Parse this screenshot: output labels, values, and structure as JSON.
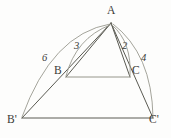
{
  "figure": {
    "type": "geometry-diagram",
    "background_color": "#fdfdfc",
    "stroke_color": "#5a5a52",
    "arc_color": "#9a9a90",
    "label_color": "#3a3a36",
    "width": 171,
    "height": 138
  },
  "vertices": {
    "A": {
      "label": "A",
      "x": 111,
      "y": 23,
      "label_x": 107,
      "label_y": 6
    },
    "B": {
      "label": "B",
      "x": 66,
      "y": 77,
      "label_x": 54,
      "label_y": 66
    },
    "C": {
      "label": "C",
      "x": 130,
      "y": 77,
      "label_x": 132,
      "label_y": 66
    },
    "Bp": {
      "label": "B'",
      "x": 22,
      "y": 118,
      "label_x": 8,
      "label_y": 115
    },
    "Cp": {
      "label": "C'",
      "x": 153,
      "y": 118,
      "label_x": 150,
      "label_y": 115
    }
  },
  "segments": [
    {
      "name": "A-Bp",
      "from": "A",
      "to": "Bp"
    },
    {
      "name": "A-B",
      "from": "A",
      "to": "B"
    },
    {
      "name": "A-C",
      "from": "A",
      "to": "C"
    },
    {
      "name": "A-Cp",
      "from": "A",
      "to": "Cp"
    },
    {
      "name": "B-C",
      "from": "B",
      "to": "C"
    },
    {
      "name": "Bp-Cp",
      "from": "Bp",
      "to": "Cp"
    }
  ],
  "arc_measures": [
    {
      "name": "arc-6",
      "value": "6",
      "spans": "A to B'",
      "label_x": 42,
      "label_y": 52
    },
    {
      "name": "arc-3",
      "value": "3",
      "spans": "A to B",
      "label_x": 74,
      "label_y": 40
    },
    {
      "name": "arc-2",
      "value": "2",
      "spans": "A to C",
      "label_x": 122,
      "label_y": 40
    },
    {
      "name": "arc-4",
      "value": "4",
      "spans": "A to C'",
      "label_x": 141,
      "label_y": 52
    }
  ]
}
